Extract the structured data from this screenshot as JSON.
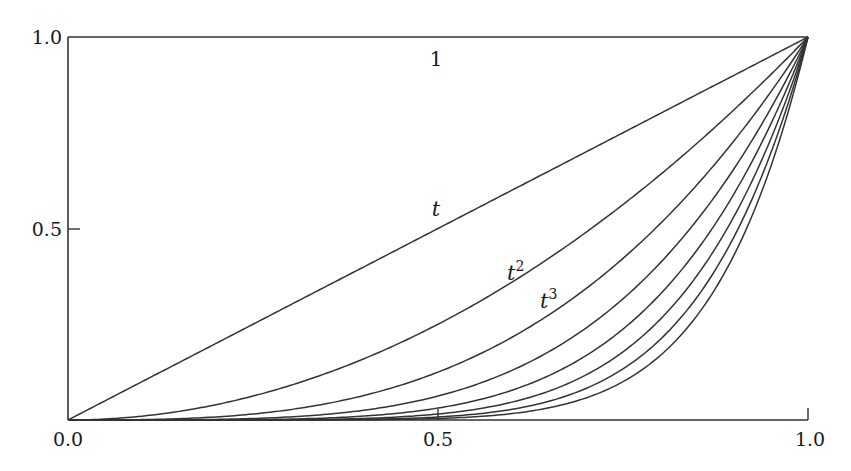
{
  "chart_data": {
    "type": "line",
    "title": "",
    "xlabel": "",
    "ylabel": "",
    "xlim": [
      0.0,
      1.0
    ],
    "ylim": [
      0.0,
      1.0
    ],
    "grid": false,
    "legend": null,
    "x_ticks": [
      {
        "value": 0.0,
        "label": "0.0"
      },
      {
        "value": 0.5,
        "label": "0.5"
      },
      {
        "value": 1.0,
        "label": "1.0"
      }
    ],
    "y_ticks": [
      {
        "value": 0.5,
        "label": "0.5"
      },
      {
        "value": 1.0,
        "label": "1.0"
      }
    ],
    "series": [
      {
        "name": "1",
        "function": "t^0",
        "exponent": 0
      },
      {
        "name": "t",
        "function": "t^1",
        "exponent": 1
      },
      {
        "name": "t^2",
        "function": "t^2",
        "exponent": 2
      },
      {
        "name": "t^3",
        "function": "t^3",
        "exponent": 3
      },
      {
        "name": "t^4",
        "function": "t^4",
        "exponent": 4
      },
      {
        "name": "t^5",
        "function": "t^5",
        "exponent": 5
      },
      {
        "name": "t^6",
        "function": "t^6",
        "exponent": 6
      },
      {
        "name": "t^7",
        "function": "t^7",
        "exponent": 7
      },
      {
        "name": "t^8",
        "function": "t^8",
        "exponent": 8
      }
    ],
    "annotations": [
      {
        "text": "1",
        "x": 0.5,
        "y": 0.96
      },
      {
        "text": "t",
        "x": 0.49,
        "y": 0.55
      },
      {
        "text": "t^2",
        "x": 0.59,
        "y": 0.38
      },
      {
        "text": "t^3",
        "x": 0.65,
        "y": 0.31
      }
    ],
    "line_color": "#333333"
  },
  "labels": {
    "x0": "0.0",
    "x05": "0.5",
    "x1": "1.0",
    "y05": "0.5",
    "y1": "1.0",
    "curve_const": "1",
    "curve_t": "t",
    "curve_t2_base": "t",
    "curve_t2_exp": "2",
    "curve_t3_base": "t",
    "curve_t3_exp": "3"
  }
}
